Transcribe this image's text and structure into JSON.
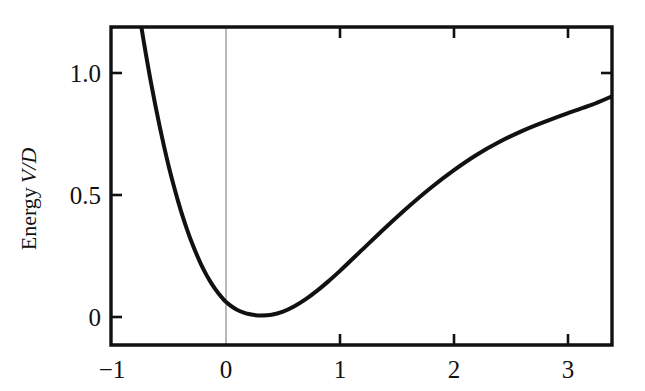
{
  "figure": {
    "background_color": "#ffffff",
    "ink_color": "#111111",
    "guide_color": "#9a9a9a"
  },
  "axes": {
    "y_label_prefix": "Energy",
    "y_label_variable": "V/D",
    "x_label": "",
    "frame": {
      "left_px": 111,
      "right_px": 612,
      "top_px": 27,
      "bottom_px": 345
    },
    "x_ticks": [
      {
        "value": -1,
        "label": "−1",
        "px": 112,
        "has_mark": false
      },
      {
        "value": 0,
        "label": "0",
        "px": 226,
        "has_mark": false
      },
      {
        "value": 1,
        "label": "1",
        "px": 340,
        "has_mark": true
      },
      {
        "value": 2,
        "label": "2",
        "px": 454,
        "has_mark": true
      },
      {
        "value": 3,
        "label": "3",
        "px": 568,
        "has_mark": true
      }
    ],
    "y_ticks": [
      {
        "value": 1.0,
        "label": "1.0",
        "px": 73
      },
      {
        "value": 0.5,
        "label": "0.5",
        "px": 195
      },
      {
        "value": 0.0,
        "label": "0",
        "px": 317
      }
    ],
    "top_ticks_px": [
      340,
      454,
      568
    ],
    "right_ticks_px": [
      73
    ],
    "guide_line": {
      "x_value": 0,
      "px": 226,
      "from_px": 27,
      "to_px": 345
    }
  },
  "chart_data": {
    "type": "line",
    "title": "",
    "subtitle": "",
    "xlabel": "",
    "ylabel": "Energy V/D",
    "xlim": [
      -1.0,
      3.39
    ],
    "ylim": [
      -0.115,
      1.3
    ],
    "grid": false,
    "legend": null,
    "annotations": [
      {
        "text": "vertical guide line at x = 0",
        "x": 0
      }
    ],
    "series": [
      {
        "name": "Morse potential V/D",
        "color": "#111111",
        "line_width_px": 4,
        "clipped_at_top": true,
        "x": [
          -0.78,
          -0.76,
          -0.74,
          -0.72,
          -0.7,
          -0.66,
          -0.62,
          -0.58,
          -0.54,
          -0.5,
          -0.46,
          -0.42,
          -0.38,
          -0.34,
          -0.3,
          -0.26,
          -0.22,
          -0.18,
          -0.14,
          -0.1,
          -0.06,
          -0.02,
          0.0,
          0.02,
          0.06,
          0.1,
          0.15,
          0.2,
          0.25,
          0.3,
          0.4,
          0.5,
          0.6,
          0.7,
          0.8,
          0.9,
          1.0,
          1.2,
          1.4,
          1.6,
          1.8,
          2.0,
          2.2,
          2.4,
          2.6,
          2.8,
          3.0,
          3.2,
          3.39
        ],
        "y": [
          1.3,
          1.24,
          1.182,
          1.125,
          1.07,
          0.966,
          0.868,
          0.777,
          0.692,
          0.613,
          0.541,
          0.474,
          0.412,
          0.356,
          0.305,
          0.259,
          0.217,
          0.18,
          0.147,
          0.118,
          0.093,
          0.071,
          0.062,
          0.054,
          0.04,
          0.029,
          0.019,
          0.012,
          0.008,
          0.006,
          0.009,
          0.022,
          0.044,
          0.073,
          0.108,
          0.147,
          0.189,
          0.278,
          0.367,
          0.452,
          0.531,
          0.602,
          0.665,
          0.718,
          0.763,
          0.801,
          0.836,
          0.868,
          0.905
        ]
      }
    ]
  }
}
